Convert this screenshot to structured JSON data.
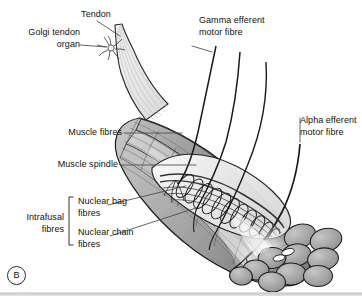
{
  "figure": {
    "panel_tag": "B",
    "background_color": "#ffffff",
    "ink_color": "#111111"
  },
  "labels": {
    "tendon": "Tendon",
    "golgi_line1": "Golgi tendon",
    "golgi_line2": "organ",
    "muscle_fibres": "Muscle fibres",
    "muscle_spindle": "Muscle spindle",
    "gamma_line1": "Gamma efferent",
    "gamma_line2": "motor fibre",
    "alpha_line1": "Alpha efferent",
    "alpha_line2": "motor fibre",
    "intrafusal_line1": "Intrafusal",
    "intrafusal_line2": "fibres",
    "nuclear_bag_line1": "Nuclear bag",
    "nuclear_bag_line2": "fibres",
    "nuclear_chain_line1": "Nuclear chain",
    "nuclear_chain_line2": "fibres"
  },
  "structures": {
    "tendon": "tapered pale fibrous cord at upper left",
    "golgi_tendon_organ": "small branching star-shaped receptor inside tendon",
    "muscle_belly": "large grey fusiform muscle belly running upper-left to lower-right",
    "muscle_spindle": "encapsulated spindle with spiral annulospiral endings inside muscle belly",
    "nuclear_bag_fibres": "thicker intrafusal fibres inside spindle capsule",
    "nuclear_chain_fibres": "thinner intrafusal fibres inside spindle capsule",
    "gamma_efferent": "thin nerve fibres entering spindle",
    "alpha_efferent": "thick nerve fibre to extrafusal muscle fibres",
    "cut_end": "rounded cut face showing extrafusal muscle fibre cross-sections at lower right"
  },
  "palette": {
    "outline": "#1b1b1b",
    "muscle_mid": "#9a9a9a",
    "muscle_dark": "#6e6e6e",
    "muscle_light": "#cfcfcf",
    "tendon": "#e8e8e8",
    "spindle_fill": "#f2f2f2",
    "leader": "#444444"
  }
}
